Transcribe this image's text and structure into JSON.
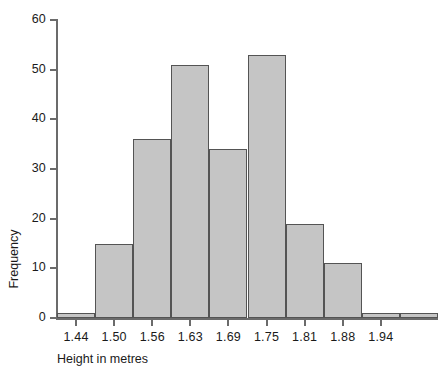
{
  "chart_data": {
    "type": "bar",
    "subtype": "histogram",
    "title": "",
    "xlabel": "Height in metres",
    "ylabel": "Frequency",
    "categories": [
      "1.44",
      "1.50",
      "1.56",
      "1.63",
      "1.69",
      "1.75",
      "1.81",
      "1.88",
      "1.94",
      ""
    ],
    "values": [
      1,
      15,
      36,
      51,
      34,
      53,
      19,
      11,
      1,
      1
    ],
    "bars": [
      {
        "label": "1.44",
        "value": 1
      },
      {
        "label": "1.50",
        "value": 15
      },
      {
        "label": "1.56",
        "value": 36
      },
      {
        "label": "1.63",
        "value": 51
      },
      {
        "label": "1.69",
        "value": 34
      },
      {
        "label": "1.75",
        "value": 53
      },
      {
        "label": "1.81",
        "value": 19
      },
      {
        "label": "1.88",
        "value": 11
      },
      {
        "label": "1.94",
        "value": 1
      }
    ],
    "xticklabels": [
      "1.44",
      "1.50",
      "1.56",
      "1.63",
      "1.69",
      "1.75",
      "1.81",
      "1.88",
      "1.94"
    ],
    "yticklabels": [
      "0",
      "10",
      "20",
      "30",
      "40",
      "50",
      "60"
    ],
    "yticks": [
      0,
      10,
      20,
      30,
      40,
      50,
      60
    ],
    "ylim": [
      0,
      60
    ],
    "grid": false,
    "legend": null,
    "colors": {
      "bar_fill": "#c5c5c5",
      "bar_edge": "#545454",
      "axis": "#6b6b6b",
      "text": "#1a1a1a",
      "background": "#ffffff"
    }
  }
}
